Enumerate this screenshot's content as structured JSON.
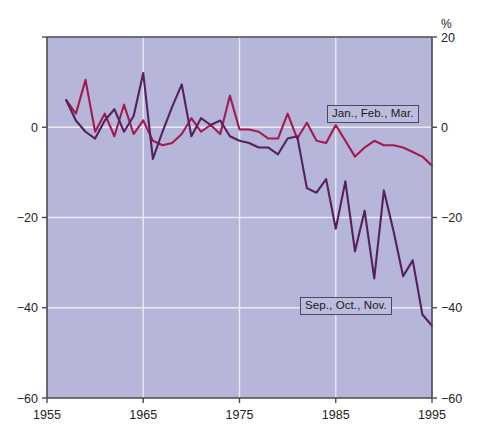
{
  "chart_data": {
    "type": "line",
    "title": "",
    "xlabel": "",
    "ylabel": "",
    "unit_label": "%",
    "xlim": [
      1955,
      1995
    ],
    "ylim": [
      -60,
      20
    ],
    "xticks": [
      1955,
      1965,
      1975,
      1985,
      1995
    ],
    "xticklabels": [
      "1955",
      "1965",
      "1975",
      "1985",
      "1995"
    ],
    "yticks": [
      20,
      0,
      -20,
      -40,
      -60
    ],
    "yticklabels_left": [
      "",
      "0",
      "−20",
      "−40",
      "−60"
    ],
    "yticklabels_right": [
      "20",
      "0",
      "−20",
      "−40",
      "−60"
    ],
    "grid": true,
    "gridlines_x": [
      1965,
      1975,
      1985
    ],
    "gridlines_y": [
      0,
      -20,
      -40
    ],
    "legend_position": "inline-annotations",
    "plot_bgcolor": "#b6b6db",
    "grid_color": "#e9e9f4",
    "axis_color": "#4a4a52",
    "series": [
      {
        "name": "Jan., Feb., Mar.",
        "color": "#a31b4e",
        "x": [
          1957,
          1958,
          1959,
          1960,
          1961,
          1962,
          1963,
          1964,
          1965,
          1966,
          1967,
          1968,
          1969,
          1970,
          1971,
          1972,
          1973,
          1974,
          1975,
          1976,
          1977,
          1978,
          1979,
          1980,
          1981,
          1982,
          1983,
          1984,
          1985,
          1986,
          1987,
          1988,
          1989,
          1990,
          1991,
          1992,
          1993,
          1994,
          1995
        ],
        "values": [
          6.0,
          3.0,
          10.5,
          -1.0,
          3.0,
          -2.0,
          5.0,
          -1.5,
          1.5,
          -3.0,
          -4.0,
          -3.5,
          -1.5,
          2.0,
          -1.0,
          0.5,
          -1.5,
          7.0,
          -0.5,
          -0.5,
          -1.0,
          -2.5,
          -2.5,
          3.0,
          -2.5,
          1.0,
          -3.0,
          -3.5,
          0.5,
          -3.0,
          -6.5,
          -4.5,
          -3.0,
          -4.0,
          -4.0,
          -4.5,
          -5.5,
          -6.5,
          -8.5
        ]
      },
      {
        "name": "Sep., Oct., Nov.",
        "color": "#55215c",
        "x": [
          1957,
          1958,
          1959,
          1960,
          1961,
          1962,
          1963,
          1964,
          1965,
          1966,
          1967,
          1968,
          1969,
          1970,
          1971,
          1972,
          1973,
          1974,
          1975,
          1976,
          1977,
          1978,
          1979,
          1980,
          1981,
          1982,
          1983,
          1984,
          1985,
          1986,
          1987,
          1988,
          1989,
          1990,
          1991,
          1992,
          1993,
          1994,
          1995
        ],
        "values": [
          6.0,
          1.5,
          -1.0,
          -2.5,
          1.5,
          4.0,
          -1.0,
          2.5,
          12.0,
          -7.0,
          -1.0,
          4.5,
          9.5,
          -2.0,
          2.0,
          0.5,
          1.5,
          -2.0,
          -3.0,
          -3.5,
          -4.5,
          -4.5,
          -6.0,
          -2.5,
          -2.0,
          -13.5,
          -14.5,
          -11.5,
          -22.5,
          -12.0,
          -27.5,
          -18.5,
          -33.5,
          -14.0,
          -23.0,
          -33.0,
          -29.5,
          -41.5,
          -44.0
        ]
      }
    ]
  }
}
